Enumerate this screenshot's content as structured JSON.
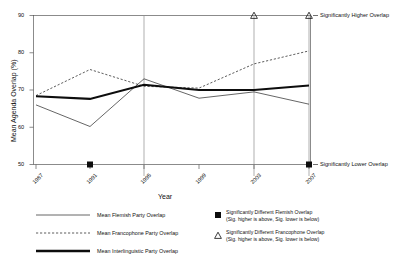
{
  "chart_data": {
    "type": "line",
    "title": "",
    "xlabel": "Year",
    "ylabel": "Mean Agenda Overlap (%)",
    "categories": [
      "1987",
      "1991",
      "1995",
      "1999",
      "2003",
      "2007"
    ],
    "x": [
      1987,
      1991,
      1995,
      1999,
      2003,
      2007
    ],
    "ylim": [
      50,
      90
    ],
    "yticks": [
      50,
      60,
      70,
      80,
      90
    ],
    "grid": "vertical gridlines at 1995, 2003, 2007",
    "legend_position": "below plot",
    "series": [
      {
        "name": "Mean Flemish Party Overlap",
        "style": "thin-solid",
        "values": [
          66.0,
          60.2,
          73.0,
          67.8,
          69.5,
          66.2
        ]
      },
      {
        "name": "Mean Francophone Party Overlap",
        "style": "dashed",
        "values": [
          68.5,
          75.5,
          71.0,
          70.5,
          77.0,
          80.5
        ]
      },
      {
        "name": "Mean Interlinguistic Party Overlap",
        "style": "thick-solid",
        "values": [
          68.3,
          67.6,
          71.4,
          70.0,
          70.0,
          71.2
        ]
      }
    ],
    "markers": [
      {
        "symbol": "square",
        "marker_name": "filled-square-marker",
        "x": 1991,
        "y": 50,
        "meaning": "Significantly Lower Overlap"
      },
      {
        "symbol": "square",
        "marker_name": "filled-square-marker",
        "x": 2007,
        "y": 50,
        "meaning": "Significantly Lower Overlap"
      },
      {
        "symbol": "triangle",
        "marker_name": "open-triangle-marker",
        "x": 2003,
        "y": 90,
        "meaning": "Significantly Higher Overlap"
      },
      {
        "symbol": "triangle",
        "marker_name": "open-triangle-marker",
        "x": 2007,
        "y": 90,
        "meaning": "Significantly Higher Overlap"
      }
    ],
    "annotations": [
      {
        "text": "Significantly Higher Overlap",
        "at_y": 90
      },
      {
        "text": "Significantly Lower Overlap",
        "at_y": 50
      }
    ]
  },
  "axes": {
    "y_title": "Mean Agenda Overlap (%)",
    "x_title": "Year",
    "y_ticks": [
      "90",
      "80",
      "70",
      "60",
      "50"
    ],
    "x_ticks": [
      "1987",
      "1991",
      "1995",
      "1999",
      "2003",
      "2007"
    ]
  },
  "annotations": {
    "higher": "Significantly Higher Overlap",
    "lower": "Significantly Lower Overlap"
  },
  "legend": {
    "line_items": [
      {
        "label": "Mean Flemish Party Overlap",
        "swatch": "thin-solid-line-swatch"
      },
      {
        "label": "Mean Francophone Party Overlap",
        "swatch": "dashed-line-swatch"
      },
      {
        "label": "Mean Interlinguistic Party Overlap",
        "swatch": "thick-solid-line-swatch"
      }
    ],
    "marker_items": [
      {
        "title": "Significantly Different Flemish Overlap",
        "subtitle": "(Sig. higher is above, Sig. lower is below)",
        "swatch": "filled-square-marker"
      },
      {
        "title": "Significantly Different Francophone Overlap",
        "subtitle": "(Sig. higher is above, Sig. lower is below)",
        "swatch": "open-triangle-marker"
      }
    ]
  },
  "colors": {
    "ink": "#111111",
    "grid": "#8a8a8a",
    "frame": "#4d4d4d"
  }
}
